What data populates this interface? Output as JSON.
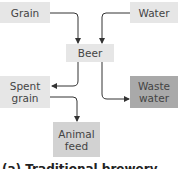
{
  "nodes": {
    "grain": {
      "label": "Grain",
      "color": "#e6e6e6"
    },
    "water": {
      "label": "Water",
      "color": "#e6e6e6"
    },
    "beer": {
      "label": "Beer",
      "color": "#e6e6e6"
    },
    "spent_grain": {
      "label": "Spent\ngrain",
      "color": "#e6e6e6"
    },
    "waste_water": {
      "label": "Waste\nwater",
      "color": "#a9a9a9"
    },
    "animal_feed": {
      "label": "Animal\nfeed",
      "color": "#d2d2d2"
    }
  },
  "edges": [
    {
      "from": "Grain",
      "to": "Beer"
    },
    {
      "from": "Water",
      "to": "Beer"
    },
    {
      "from": "Beer",
      "to": "Spent grain"
    },
    {
      "from": "Beer",
      "to": "Waste water"
    },
    {
      "from": "Spent grain",
      "to": "Animal feed"
    }
  ],
  "caption": "(a) Traditional brewery"
}
